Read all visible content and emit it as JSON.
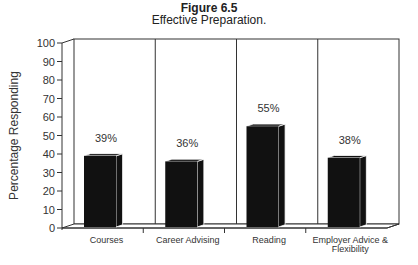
{
  "chart_data": {
    "type": "bar",
    "title": "Figure 6.5",
    "subtitle": "Effective Preparation.",
    "xlabel": "",
    "ylabel": "Percentage Responding",
    "ylim": [
      0,
      100
    ],
    "yticks": [
      0,
      10,
      20,
      30,
      40,
      50,
      60,
      70,
      80,
      90,
      100
    ],
    "categories": [
      "Courses",
      "Career Advising",
      "Reading",
      "Employer Advice & Flexibility"
    ],
    "category_lines": [
      [
        "Courses"
      ],
      [
        "Career Advising"
      ],
      [
        "Reading"
      ],
      [
        "Employer Advice &",
        "Flexibility"
      ]
    ],
    "values": [
      39,
      36,
      55,
      38
    ],
    "value_labels": [
      "39%",
      "36%",
      "55%",
      "38%"
    ],
    "style": "3d-bar",
    "bar_color": "#111111",
    "grid": false,
    "legend": null
  }
}
